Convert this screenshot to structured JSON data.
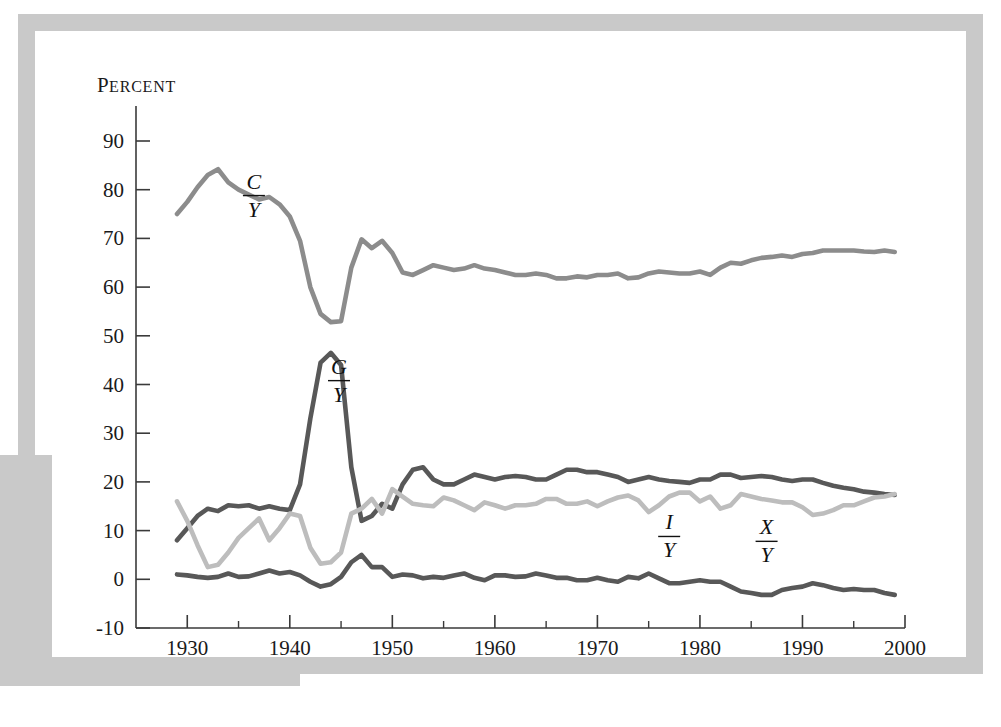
{
  "figure": {
    "axis_title": "Percent",
    "frame_color": "#c9c9c9",
    "background": "#ffffff"
  },
  "chart_data": {
    "type": "line",
    "title": "",
    "subtitle": "",
    "xlabel": "",
    "ylabel": "Percent",
    "xlim": [
      1925,
      2000
    ],
    "ylim": [
      -10,
      90
    ],
    "grid": false,
    "legend": "inline-annotations",
    "x_ticks_major": [
      1930,
      1940,
      1950,
      1960,
      1970,
      1980,
      1990,
      2000
    ],
    "x_ticks_minor": [
      1935,
      1945,
      1955,
      1965,
      1975,
      1985,
      1995
    ],
    "x_tick_labels": [
      "1930",
      "1940",
      "1950",
      "1960",
      "1970",
      "1980",
      "1990",
      "2000"
    ],
    "y_ticks": [
      -10,
      0,
      10,
      20,
      30,
      40,
      50,
      60,
      70,
      80,
      90
    ],
    "y_tick_labels": [
      "-10",
      "0",
      "10",
      "20",
      "30",
      "40",
      "50",
      "60",
      "70",
      "80",
      "90"
    ],
    "x": [
      1929,
      1930,
      1931,
      1932,
      1933,
      1934,
      1935,
      1936,
      1937,
      1938,
      1939,
      1940,
      1941,
      1942,
      1943,
      1944,
      1945,
      1946,
      1947,
      1948,
      1949,
      1950,
      1951,
      1952,
      1953,
      1954,
      1955,
      1956,
      1957,
      1958,
      1959,
      1960,
      1961,
      1962,
      1963,
      1964,
      1965,
      1966,
      1967,
      1968,
      1969,
      1970,
      1971,
      1972,
      1973,
      1974,
      1975,
      1976,
      1977,
      1978,
      1979,
      1980,
      1981,
      1982,
      1983,
      1984,
      1985,
      1986,
      1987,
      1988,
      1989,
      1990,
      1991,
      1992,
      1993,
      1994,
      1995,
      1996,
      1997,
      1998,
      1999
    ],
    "series": [
      {
        "name": "C/Y",
        "label_numerator": "C",
        "label_denominator": "Y",
        "color": "#8c8c8c",
        "label_x": 1936.5,
        "label_y": 79,
        "values": [
          75.0,
          77.5,
          80.5,
          83.0,
          84.2,
          81.5,
          80.0,
          79.0,
          78.0,
          78.5,
          77.0,
          74.5,
          69.5,
          60.0,
          54.5,
          52.8,
          53.0,
          64.0,
          69.8,
          68.0,
          69.5,
          67.0,
          63.0,
          62.5,
          63.5,
          64.5,
          64.0,
          63.5,
          63.8,
          64.5,
          63.8,
          63.5,
          63.0,
          62.5,
          62.5,
          62.8,
          62.5,
          61.8,
          61.8,
          62.2,
          62.0,
          62.5,
          62.5,
          62.8,
          61.8,
          62.0,
          62.8,
          63.2,
          63.0,
          62.8,
          62.8,
          63.2,
          62.5,
          64.0,
          65.0,
          64.8,
          65.5,
          66.0,
          66.2,
          66.5,
          66.2,
          66.8,
          67.0,
          67.5,
          67.5,
          67.5,
          67.5,
          67.3,
          67.2,
          67.5,
          67.2
        ]
      },
      {
        "name": "G/Y",
        "label_numerator": "G",
        "label_denominator": "Y",
        "color": "#585858",
        "label_x": 1944.8,
        "label_y": 41,
        "values": [
          8.0,
          10.5,
          13.0,
          14.5,
          14.0,
          15.2,
          15.0,
          15.2,
          14.5,
          15.0,
          14.5,
          14.2,
          19.5,
          33.0,
          44.5,
          46.5,
          44.0,
          23.0,
          12.0,
          13.0,
          15.5,
          14.5,
          19.5,
          22.5,
          23.0,
          20.5,
          19.5,
          19.5,
          20.5,
          21.5,
          21.0,
          20.5,
          21.0,
          21.2,
          21.0,
          20.5,
          20.5,
          21.5,
          22.5,
          22.5,
          22.0,
          22.0,
          21.5,
          21.0,
          20.0,
          20.5,
          21.0,
          20.5,
          20.2,
          20.0,
          19.8,
          20.5,
          20.5,
          21.5,
          21.5,
          20.8,
          21.0,
          21.2,
          21.0,
          20.5,
          20.2,
          20.5,
          20.5,
          19.8,
          19.2,
          18.8,
          18.5,
          18.0,
          17.8,
          17.5,
          17.3
        ]
      },
      {
        "name": "I/Y",
        "label_numerator": "I",
        "label_denominator": "Y",
        "color": "#bdbdbd",
        "label_x": 1977,
        "label_y": 9,
        "values": [
          16.0,
          12.0,
          7.0,
          2.5,
          3.0,
          5.5,
          8.5,
          10.5,
          12.5,
          8.0,
          10.5,
          13.5,
          13.0,
          6.5,
          3.2,
          3.5,
          5.5,
          13.5,
          14.5,
          16.5,
          13.5,
          18.5,
          17.0,
          15.5,
          15.2,
          15.0,
          16.8,
          16.2,
          15.2,
          14.2,
          15.8,
          15.2,
          14.5,
          15.2,
          15.2,
          15.5,
          16.5,
          16.5,
          15.5,
          15.5,
          16.0,
          15.0,
          16.0,
          16.8,
          17.2,
          16.2,
          13.8,
          15.2,
          17.0,
          17.8,
          17.8,
          16.0,
          17.0,
          14.5,
          15.2,
          17.5,
          17.0,
          16.5,
          16.2,
          15.8,
          15.8,
          14.8,
          13.2,
          13.5,
          14.2,
          15.2,
          15.2,
          16.0,
          16.8,
          17.0,
          17.5
        ]
      },
      {
        "name": "X/Y",
        "label_numerator": "X",
        "label_denominator": "Y",
        "color": "#585858",
        "label_x": 1986.5,
        "label_y": 8,
        "values": [
          1.0,
          0.8,
          0.5,
          0.3,
          0.5,
          1.2,
          0.5,
          0.6,
          1.2,
          1.8,
          1.2,
          1.5,
          0.8,
          -0.5,
          -1.5,
          -1.0,
          0.5,
          3.5,
          5.0,
          2.5,
          2.5,
          0.5,
          1.0,
          0.8,
          0.2,
          0.5,
          0.3,
          0.8,
          1.2,
          0.3,
          -0.2,
          0.8,
          0.8,
          0.5,
          0.6,
          1.2,
          0.8,
          0.3,
          0.3,
          -0.2,
          -0.2,
          0.3,
          -0.2,
          -0.5,
          0.5,
          0.2,
          1.2,
          0.2,
          -0.8,
          -0.8,
          -0.5,
          -0.2,
          -0.5,
          -0.5,
          -1.5,
          -2.5,
          -2.8,
          -3.2,
          -3.2,
          -2.2,
          -1.8,
          -1.5,
          -0.8,
          -1.2,
          -1.8,
          -2.2,
          -2.0,
          -2.2,
          -2.2,
          -2.8,
          -3.2
        ]
      }
    ]
  }
}
